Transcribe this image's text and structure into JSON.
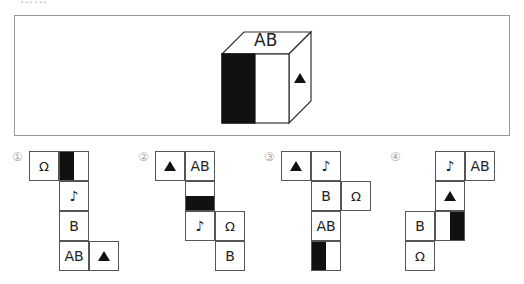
{
  "header_fragment": "……",
  "question": {
    "cube": {
      "top_face": "AB",
      "front_face": "half-black",
      "right_face": "triangle"
    }
  },
  "options": [
    {
      "label": "①",
      "left": 29,
      "top": 151,
      "cells": [
        {
          "col": 0,
          "row": 0,
          "text": "Ω",
          "type": "text"
        },
        {
          "col": 1,
          "row": 0,
          "type": "bar-left"
        },
        {
          "col": 1,
          "row": 1,
          "text": "♪",
          "type": "text"
        },
        {
          "col": 1,
          "row": 2,
          "text": "B",
          "type": "text"
        },
        {
          "col": 1,
          "row": 3,
          "text": "AB",
          "type": "text"
        },
        {
          "col": 2,
          "row": 3,
          "type": "triangle"
        }
      ]
    },
    {
      "label": "②",
      "left": 155,
      "top": 151,
      "cells": [
        {
          "col": 0,
          "row": 0,
          "type": "triangle"
        },
        {
          "col": 1,
          "row": 0,
          "text": "AB",
          "type": "text"
        },
        {
          "col": 1,
          "row": 1,
          "type": "bar-bottom"
        },
        {
          "col": 1,
          "row": 2,
          "text": "♪",
          "type": "text"
        },
        {
          "col": 2,
          "row": 2,
          "text": "Ω",
          "type": "text"
        },
        {
          "col": 2,
          "row": 3,
          "text": "B",
          "type": "text"
        }
      ]
    },
    {
      "label": "③",
      "left": 281,
      "top": 151,
      "cells": [
        {
          "col": 0,
          "row": 0,
          "type": "triangle"
        },
        {
          "col": 1,
          "row": 0,
          "text": "♪",
          "type": "text"
        },
        {
          "col": 1,
          "row": 1,
          "text": "B",
          "type": "text"
        },
        {
          "col": 2,
          "row": 1,
          "text": "Ω",
          "type": "text"
        },
        {
          "col": 1,
          "row": 2,
          "text": "AB",
          "type": "text"
        },
        {
          "col": 1,
          "row": 3,
          "type": "bar-left"
        }
      ]
    },
    {
      "label": "④",
      "left": 405,
      "top": 151,
      "cells": [
        {
          "col": 1,
          "row": 0,
          "text": "♪",
          "type": "text"
        },
        {
          "col": 2,
          "row": 0,
          "text": "AB",
          "type": "text"
        },
        {
          "col": 1,
          "row": 1,
          "type": "triangle"
        },
        {
          "col": 0,
          "row": 2,
          "text": "B",
          "type": "text"
        },
        {
          "col": 1,
          "row": 2,
          "type": "bar-right"
        },
        {
          "col": 0,
          "row": 3,
          "text": "Ω",
          "type": "text"
        }
      ]
    }
  ],
  "option_label_positions": [
    [
      12,
      150
    ],
    [
      138,
      150
    ],
    [
      264,
      150
    ],
    [
      390,
      150
    ]
  ]
}
